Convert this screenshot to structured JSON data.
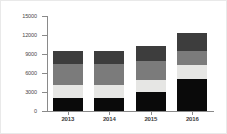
{
  "chart_data": {
    "type": "bar",
    "stacked": true,
    "title": "",
    "subtitle": "",
    "xlabel": "",
    "ylabel": "",
    "categories": [
      "2013",
      "2014",
      "2015",
      "2016"
    ],
    "ylim": [
      0,
      15000
    ],
    "ytick_labels": [
      "0",
      "3000",
      "6000",
      "9000",
      "12000",
      "15000"
    ],
    "ytick_values": [
      0,
      3000,
      6000,
      9000,
      12000,
      15000
    ],
    "grid": false,
    "legend": "none",
    "series": [
      {
        "name": "series-1",
        "color": "#0a0a0a",
        "values": [
          2000,
          2100,
          3000,
          5100
        ]
      },
      {
        "name": "series-2",
        "color": "#e6e6e4",
        "values": [
          2100,
          2000,
          1900,
          2200
        ]
      },
      {
        "name": "series-3",
        "color": "#7b7b7b",
        "values": [
          3300,
          3400,
          3000,
          2200
        ]
      },
      {
        "name": "series-4",
        "color": "#3d3d3d",
        "values": [
          2000,
          2000,
          2300,
          2800
        ]
      }
    ],
    "totals": [
      9400,
      9500,
      10200,
      12300
    ],
    "axis_color": "#8a8a8a",
    "background": "#ffffff",
    "border_color": "#e9e9e9"
  }
}
